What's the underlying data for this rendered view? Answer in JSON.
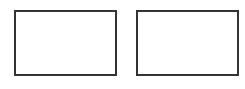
{
  "diagram": {
    "shapes": [
      {
        "id": "left",
        "type": "rectangle",
        "label": ""
      },
      {
        "id": "right",
        "type": "rectangle",
        "label": ""
      }
    ],
    "colors": {
      "border": "#333333",
      "fill": "#ffffff",
      "background": "#ffffff"
    }
  }
}
